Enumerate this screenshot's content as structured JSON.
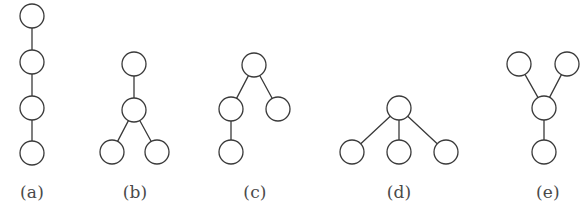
{
  "figure": {
    "width": 580,
    "height": 222,
    "background_color": "#ffffff",
    "stroke_color": "#3a3a3a",
    "node_fill_color": "#ffffff",
    "label_color": "#4a4a4a",
    "node_radius": 12,
    "stroke_width": 1.3,
    "caption_faint": ""
  },
  "chart_data": {
    "type": "diagram",
    "title": "",
    "subtitle": "",
    "legend": [],
    "panels": [
      {
        "id": "a",
        "label": "(a)",
        "label_x": 32,
        "label_y": 197,
        "node_count": 4,
        "edge_count": 3,
        "shape": "path",
        "nodes": [
          {
            "id": "a1",
            "cx": 32,
            "cy": 16
          },
          {
            "id": "a2",
            "cx": 32,
            "cy": 62
          },
          {
            "id": "a3",
            "cx": 32,
            "cy": 108
          },
          {
            "id": "a4",
            "cx": 32,
            "cy": 153
          }
        ],
        "edges": [
          {
            "from": "a1",
            "to": "a2"
          },
          {
            "from": "a2",
            "to": "a3"
          },
          {
            "from": "a3",
            "to": "a4"
          }
        ]
      },
      {
        "id": "b",
        "label": "(b)",
        "label_x": 135,
        "label_y": 197,
        "node_count": 4,
        "edge_count": 3,
        "shape": "chain-with-two-leaves",
        "nodes": [
          {
            "id": "b1",
            "cx": 134,
            "cy": 64
          },
          {
            "id": "b2",
            "cx": 134,
            "cy": 110
          },
          {
            "id": "b3",
            "cx": 112,
            "cy": 152
          },
          {
            "id": "b4",
            "cx": 157,
            "cy": 152
          }
        ],
        "edges": [
          {
            "from": "b1",
            "to": "b2"
          },
          {
            "from": "b2",
            "to": "b3"
          },
          {
            "from": "b2",
            "to": "b4"
          }
        ]
      },
      {
        "id": "c",
        "label": "(c)",
        "label_x": 255,
        "label_y": 197,
        "node_count": 4,
        "edge_count": 3,
        "shape": "root-two-children-one-grandchild",
        "nodes": [
          {
            "id": "c1",
            "cx": 254,
            "cy": 65
          },
          {
            "id": "c2",
            "cx": 231,
            "cy": 109
          },
          {
            "id": "c3",
            "cx": 278,
            "cy": 109
          },
          {
            "id": "c4",
            "cx": 231,
            "cy": 152
          }
        ],
        "edges": [
          {
            "from": "c1",
            "to": "c2"
          },
          {
            "from": "c1",
            "to": "c3"
          },
          {
            "from": "c2",
            "to": "c4"
          }
        ]
      },
      {
        "id": "d",
        "label": "(d)",
        "label_x": 399,
        "label_y": 197,
        "node_count": 4,
        "edge_count": 3,
        "shape": "star",
        "nodes": [
          {
            "id": "d1",
            "cx": 399,
            "cy": 108
          },
          {
            "id": "d2",
            "cx": 352,
            "cy": 152
          },
          {
            "id": "d3",
            "cx": 399,
            "cy": 152
          },
          {
            "id": "d4",
            "cx": 446,
            "cy": 152
          }
        ],
        "edges": [
          {
            "from": "d1",
            "to": "d2"
          },
          {
            "from": "d1",
            "to": "d3"
          },
          {
            "from": "d1",
            "to": "d4"
          }
        ]
      },
      {
        "id": "e",
        "label": "(e)",
        "label_x": 548,
        "label_y": 197,
        "node_count": 4,
        "edge_count": 3,
        "shape": "y-shape",
        "nodes": [
          {
            "id": "e1",
            "cx": 519,
            "cy": 64
          },
          {
            "id": "e2",
            "cx": 567,
            "cy": 64
          },
          {
            "id": "e3",
            "cx": 544,
            "cy": 108
          },
          {
            "id": "e4",
            "cx": 544,
            "cy": 152
          }
        ],
        "edges": [
          {
            "from": "e1",
            "to": "e3"
          },
          {
            "from": "e2",
            "to": "e3"
          },
          {
            "from": "e3",
            "to": "e4"
          }
        ]
      }
    ]
  }
}
